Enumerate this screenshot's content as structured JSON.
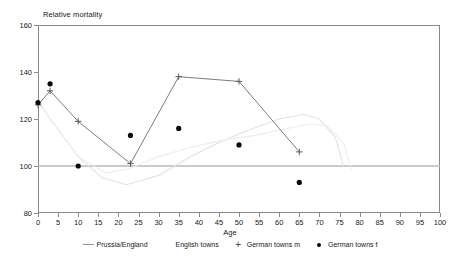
{
  "chart_data": {
    "type": "line",
    "title": "Relative mortality",
    "xlabel": "Age",
    "ylabel": "",
    "xlim": [
      0,
      100
    ],
    "ylim": [
      80,
      160
    ],
    "grid": false,
    "legend_position": "bottom",
    "x_ticks": [
      0,
      5,
      10,
      15,
      20,
      25,
      30,
      35,
      40,
      45,
      50,
      55,
      60,
      65,
      70,
      75,
      80,
      85,
      90,
      95,
      100
    ],
    "y_ticks": [
      80,
      100,
      120,
      140,
      160
    ],
    "reference_line": 100,
    "series": [
      {
        "name": "Prussia/England",
        "marker": "none",
        "style": "line",
        "color": "#e2e2e2",
        "points": [
          {
            "x": 0,
            "y": 128
          },
          {
            "x": 3,
            "y": 120
          },
          {
            "x": 10,
            "y": 104
          },
          {
            "x": 16,
            "y": 95
          },
          {
            "x": 22,
            "y": 92
          },
          {
            "x": 30,
            "y": 96
          },
          {
            "x": 38,
            "y": 104
          },
          {
            "x": 45,
            "y": 110
          },
          {
            "x": 52,
            "y": 115
          },
          {
            "x": 60,
            "y": 120
          },
          {
            "x": 66,
            "y": 122
          },
          {
            "x": 70,
            "y": 120
          },
          {
            "x": 74,
            "y": 112
          },
          {
            "x": 76,
            "y": 100
          }
        ]
      },
      {
        "name": "English towns",
        "marker": "none",
        "style": "line",
        "color": "#ededed",
        "points": [
          {
            "x": 0,
            "y": 127
          },
          {
            "x": 4,
            "y": 118
          },
          {
            "x": 10,
            "y": 104
          },
          {
            "x": 17,
            "y": 97
          },
          {
            "x": 23,
            "y": 99
          },
          {
            "x": 30,
            "y": 104
          },
          {
            "x": 38,
            "y": 108
          },
          {
            "x": 46,
            "y": 111
          },
          {
            "x": 54,
            "y": 113
          },
          {
            "x": 62,
            "y": 116
          },
          {
            "x": 68,
            "y": 118
          },
          {
            "x": 72,
            "y": 117
          },
          {
            "x": 76,
            "y": 110
          },
          {
            "x": 78,
            "y": 98
          }
        ]
      },
      {
        "name": "German towns m",
        "marker": "plus",
        "style": "line+marker",
        "color": "#5a5a5a",
        "points": [
          {
            "x": 0,
            "y": 126
          },
          {
            "x": 3,
            "y": 132
          },
          {
            "x": 10,
            "y": 119
          },
          {
            "x": 23,
            "y": 101
          },
          {
            "x": 35,
            "y": 138
          },
          {
            "x": 50,
            "y": 136
          },
          {
            "x": 65,
            "y": 106
          }
        ]
      },
      {
        "name": "German towns f",
        "marker": "dot",
        "style": "marker",
        "color": "#0a0a0a",
        "points": [
          {
            "x": 0,
            "y": 127
          },
          {
            "x": 3,
            "y": 135
          },
          {
            "x": 10,
            "y": 100
          },
          {
            "x": 23,
            "y": 113
          },
          {
            "x": 35,
            "y": 116
          },
          {
            "x": 50,
            "y": 109
          },
          {
            "x": 65,
            "y": 93
          }
        ]
      }
    ]
  },
  "legend": {
    "items": [
      {
        "label": "Prussia/England",
        "marker": "line"
      },
      {
        "label": "English towns",
        "marker": "none"
      },
      {
        "label": "German towns m",
        "marker": "plus"
      },
      {
        "label": "German towns f",
        "marker": "dot"
      }
    ]
  }
}
